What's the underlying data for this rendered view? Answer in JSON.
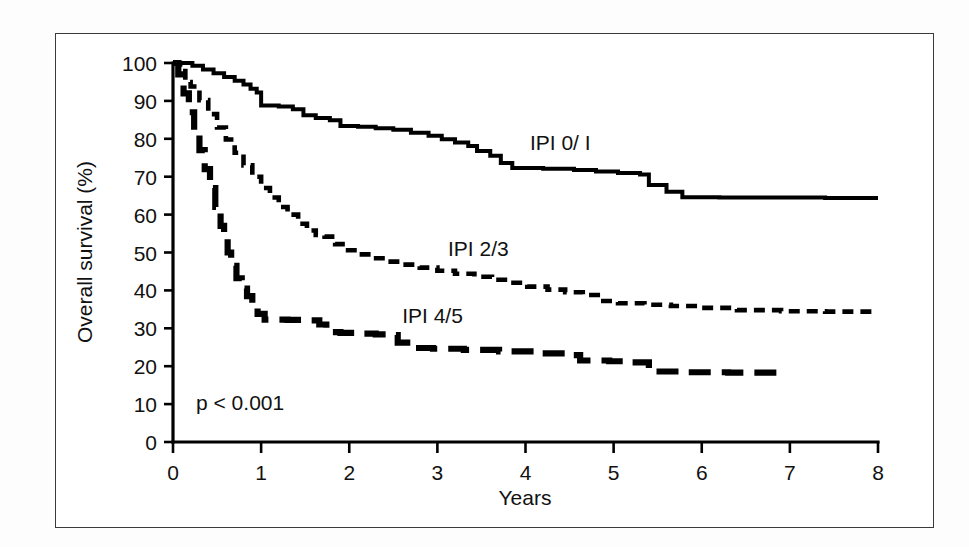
{
  "figure": {
    "background_color": "#ffffff",
    "frame_color": "#3a3a3a",
    "ink_color": "#000000"
  },
  "annotations": {
    "pvalue": "p < 0.001",
    "label_ipi01": "IPI 0/ I",
    "label_ipi23": "IPI 2/3",
    "label_ipi45": "IPI 4/5"
  },
  "chart_data": {
    "type": "line",
    "title": "",
    "subtitle": "",
    "xlabel": "Years",
    "ylabel": "Overall survival (%)",
    "xlim": [
      0,
      8
    ],
    "ylim": [
      0,
      100
    ],
    "xticks": [
      0,
      1,
      2,
      3,
      4,
      5,
      6,
      7,
      8
    ],
    "xtick_labels": [
      "0",
      "1",
      "2",
      "3",
      "4",
      "5",
      "6",
      "7",
      "8"
    ],
    "yticks": [
      0,
      10,
      20,
      30,
      40,
      50,
      60,
      70,
      80,
      90,
      100
    ],
    "ytick_labels": [
      "0",
      "10",
      "20",
      "30",
      "40",
      "50",
      "60",
      "70",
      "80",
      "90",
      "100"
    ],
    "grid": false,
    "legend_position": "inline-annotation",
    "annotations": [
      "p < 0.001"
    ],
    "series": [
      {
        "name": "IPI 0/ I",
        "linestyle": "solid",
        "label_x": 4.05,
        "label_y": 77.0,
        "points": [
          [
            0.0,
            100.0
          ],
          [
            0.1,
            100.0
          ],
          [
            0.22,
            99.3
          ],
          [
            0.34,
            98.3
          ],
          [
            0.46,
            97.3
          ],
          [
            0.58,
            96.3
          ],
          [
            0.7,
            95.3
          ],
          [
            0.8,
            94.3
          ],
          [
            0.88,
            93.2
          ],
          [
            0.95,
            92.2
          ],
          [
            1.0,
            88.8
          ],
          [
            1.2,
            88.5
          ],
          [
            1.36,
            87.8
          ],
          [
            1.48,
            86.2
          ],
          [
            1.62,
            85.5
          ],
          [
            1.78,
            84.9
          ],
          [
            1.9,
            83.4
          ],
          [
            2.1,
            83.2
          ],
          [
            2.3,
            82.8
          ],
          [
            2.5,
            82.4
          ],
          [
            2.7,
            81.6
          ],
          [
            2.9,
            80.8
          ],
          [
            3.05,
            79.9
          ],
          [
            3.2,
            79.0
          ],
          [
            3.35,
            78.1
          ],
          [
            3.45,
            76.8
          ],
          [
            3.6,
            75.5
          ],
          [
            3.72,
            73.6
          ],
          [
            3.85,
            72.3
          ],
          [
            4.2,
            72.1
          ],
          [
            4.55,
            71.8
          ],
          [
            4.8,
            71.4
          ],
          [
            5.05,
            71.0
          ],
          [
            5.3,
            70.6
          ],
          [
            5.4,
            67.8
          ],
          [
            5.6,
            66.0
          ],
          [
            5.78,
            64.6
          ],
          [
            6.2,
            64.5
          ],
          [
            6.8,
            64.5
          ],
          [
            7.4,
            64.4
          ],
          [
            8.0,
            64.4
          ]
        ]
      },
      {
        "name": "IPI 2/3",
        "linestyle": "dashed",
        "label_x": 3.12,
        "label_y": 49.0,
        "points": [
          [
            0.0,
            100.0
          ],
          [
            0.08,
            99.0
          ],
          [
            0.14,
            95.0
          ],
          [
            0.2,
            93.8
          ],
          [
            0.3,
            90.2
          ],
          [
            0.4,
            86.5
          ],
          [
            0.5,
            83.0
          ],
          [
            0.6,
            79.8
          ],
          [
            0.7,
            76.3
          ],
          [
            0.8,
            73.0
          ],
          [
            0.9,
            70.0
          ],
          [
            1.0,
            67.0
          ],
          [
            1.1,
            64.5
          ],
          [
            1.2,
            62.0
          ],
          [
            1.3,
            60.0
          ],
          [
            1.42,
            57.6
          ],
          [
            1.52,
            55.8
          ],
          [
            1.62,
            54.6
          ],
          [
            1.72,
            54.2
          ],
          [
            1.84,
            52.2
          ],
          [
            1.96,
            50.6
          ],
          [
            2.1,
            49.5
          ],
          [
            2.26,
            48.5
          ],
          [
            2.42,
            47.6
          ],
          [
            2.6,
            46.8
          ],
          [
            2.8,
            46.0
          ],
          [
            3.0,
            45.2
          ],
          [
            3.2,
            44.4
          ],
          [
            3.42,
            43.6
          ],
          [
            3.62,
            42.8
          ],
          [
            3.82,
            42.0
          ],
          [
            4.02,
            41.0
          ],
          [
            4.25,
            40.2
          ],
          [
            4.45,
            39.5
          ],
          [
            4.65,
            38.8
          ],
          [
            4.82,
            37.2
          ],
          [
            5.05,
            36.6
          ],
          [
            5.35,
            36.2
          ],
          [
            5.65,
            35.9
          ],
          [
            6.0,
            35.4
          ],
          [
            6.4,
            34.8
          ],
          [
            6.9,
            34.5
          ],
          [
            7.4,
            34.4
          ],
          [
            8.0,
            34.4
          ]
        ]
      },
      {
        "name": "IPI 4/5",
        "linestyle": "long-dash",
        "label_x": 2.6,
        "label_y": 31.5,
        "points": [
          [
            0.0,
            100.0
          ],
          [
            0.06,
            97.0
          ],
          [
            0.12,
            92.0
          ],
          [
            0.18,
            87.0
          ],
          [
            0.24,
            82.0
          ],
          [
            0.3,
            77.0
          ],
          [
            0.36,
            72.0
          ],
          [
            0.42,
            67.0
          ],
          [
            0.48,
            62.0
          ],
          [
            0.54,
            57.0
          ],
          [
            0.58,
            53.5
          ],
          [
            0.62,
            50.0
          ],
          [
            0.66,
            46.5
          ],
          [
            0.72,
            43.2
          ],
          [
            0.78,
            40.5
          ],
          [
            0.84,
            38.5
          ],
          [
            0.9,
            36.0
          ],
          [
            0.96,
            33.8
          ],
          [
            1.04,
            32.3
          ],
          [
            1.3,
            32.2
          ],
          [
            1.55,
            32.1
          ],
          [
            1.66,
            31.0
          ],
          [
            1.74,
            29.0
          ],
          [
            1.9,
            28.8
          ],
          [
            2.1,
            28.6
          ],
          [
            2.3,
            28.4
          ],
          [
            2.46,
            28.2
          ],
          [
            2.55,
            26.2
          ],
          [
            2.7,
            24.8
          ],
          [
            2.95,
            24.6
          ],
          [
            3.3,
            24.3
          ],
          [
            3.7,
            23.9
          ],
          [
            4.1,
            23.4
          ],
          [
            4.45,
            22.9
          ],
          [
            4.62,
            21.5
          ],
          [
            4.95,
            21.3
          ],
          [
            5.2,
            21.0
          ],
          [
            5.4,
            18.6
          ],
          [
            5.8,
            18.4
          ],
          [
            6.3,
            18.3
          ],
          [
            6.9,
            18.3
          ]
        ]
      }
    ]
  }
}
